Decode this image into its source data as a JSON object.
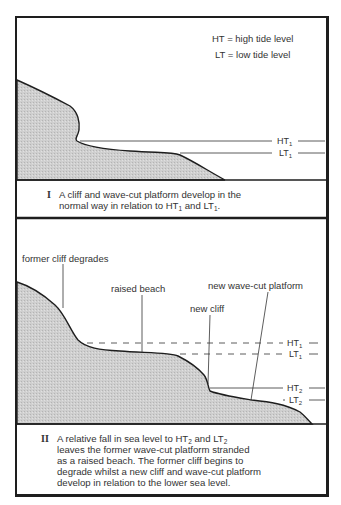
{
  "legend": {
    "ht": "HT = high tide level",
    "lt": "LT = low tide level"
  },
  "panel_1": {
    "level_labels": {
      "ht1": "HT",
      "ht1_sub": "1",
      "lt1": "LT",
      "lt1_sub": "1"
    },
    "caption": {
      "numeral": "I",
      "line1": "A cliff and wave-cut platform develop in the",
      "line2_a": "normal way in relation to HT",
      "line2_sub1": "1",
      "line2_b": " and LT",
      "line2_sub2": "1",
      "line2_c": "."
    }
  },
  "panel_2": {
    "annotations": {
      "former_cliff": "former cliff degrades",
      "raised_beach": "raised beach",
      "new_cliff": "new cliff",
      "new_platform": "new wave-cut platform"
    },
    "level_labels": {
      "ht1": "HT",
      "ht1_sub": "1",
      "lt1": "LT",
      "lt1_sub": "1",
      "ht2": "HT",
      "ht2_sub": "2",
      "lt2": "LT",
      "lt2_sub": "2"
    },
    "caption": {
      "numeral": "II",
      "line1_a": "A relative fall in sea level to HT",
      "line1_sub1": "2",
      "line1_b": " and LT",
      "line1_sub2": "2",
      "line2": "leaves the former wave-cut platform stranded",
      "line3": "as a raised beach. The former cliff begins to",
      "line4": "degrade whilst a new cliff and wave-cut platform",
      "line5": "develop in relation to the lower sea level."
    }
  },
  "colors": {
    "rock_fill": "#c8c8c8",
    "outline": "#1e1e1e",
    "background": "#ffffff"
  }
}
